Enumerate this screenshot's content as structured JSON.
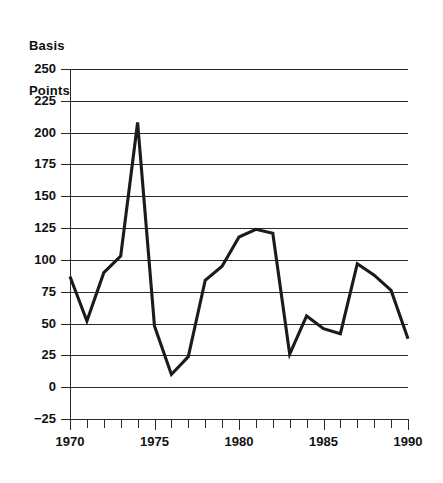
{
  "chart_data": {
    "type": "line",
    "title": "",
    "ylabel": "Basis Points",
    "ylabel_lines": [
      "Basis",
      "Points"
    ],
    "xlabel": "",
    "grid": true,
    "legend": "none",
    "xlim": [
      1970,
      1990
    ],
    "ylim": [
      -25,
      250
    ],
    "ytick_step": 25,
    "xtick_step": 1,
    "xtick_label_step": 5,
    "yticks": [
      250,
      225,
      200,
      175,
      150,
      125,
      100,
      75,
      50,
      25,
      0,
      -25
    ],
    "ytick_labels": [
      "250",
      "225",
      "200",
      "175",
      "150",
      "125",
      "100",
      "75",
      "50",
      "25",
      "0",
      "−25"
    ],
    "xticks": [
      1970,
      1971,
      1972,
      1973,
      1974,
      1975,
      1976,
      1977,
      1978,
      1979,
      1980,
      1981,
      1982,
      1983,
      1984,
      1985,
      1986,
      1987,
      1988,
      1989,
      1990
    ],
    "xtick_labels": [
      "1970",
      "",
      "",
      "",
      "",
      "1975",
      "",
      "",
      "",
      "",
      "1980",
      "",
      "",
      "",
      "",
      "1985",
      "",
      "",
      "",
      "",
      "1990"
    ],
    "xtick_labels_shown": [
      "1970",
      "1975",
      "1980",
      "1985",
      "1990"
    ],
    "series": [
      {
        "name": "Basis Points",
        "color": "#1b1b1b",
        "x": [
          1970,
          1971,
          1972,
          1973,
          1974,
          1975,
          1976,
          1977,
          1978,
          1979,
          1980,
          1981,
          1982,
          1983,
          1984,
          1985,
          1986,
          1987,
          1988,
          1989,
          1990
        ],
        "values": [
          87,
          52,
          90,
          103,
          208,
          48,
          10,
          24,
          84,
          95,
          118,
          124,
          121,
          26,
          56,
          46,
          42,
          97,
          88,
          76,
          38
        ]
      }
    ],
    "annotations": []
  },
  "axis": {
    "y_title_line1": "Basis",
    "y_title_line2": "Points"
  }
}
